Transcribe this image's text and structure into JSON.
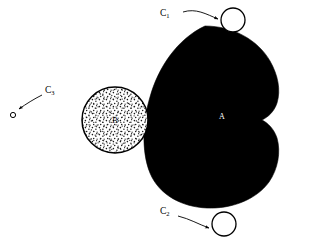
{
  "figure": {
    "background_color": "#ffffff",
    "ink_color": "#000000",
    "stipple_color": "#000000",
    "width": 309,
    "height": 248
  },
  "shapes": {
    "body_a": {
      "label": "A",
      "label_color": "#ffffff",
      "fill": "#000000",
      "label_x": 222,
      "label_y": 117,
      "description": "large-black-filled-blob-with-right-notch"
    },
    "body_b": {
      "label": "B",
      "label_color": "#000000",
      "fill": "stippled",
      "cx": 115,
      "cy": 120,
      "r": 33,
      "label_x": 115,
      "label_y": 121,
      "description": "stippled-outlined-circle"
    }
  },
  "callouts": [
    {
      "id": "c1",
      "letter": "C",
      "subscript": "1",
      "label_x": 160,
      "label_y": 14,
      "circle_cx": 233,
      "circle_cy": 20,
      "circle_r": 12,
      "arrow_from_x": 182,
      "arrow_from_y": 12,
      "arrow_to_x": 219,
      "arrow_to_y": 20
    },
    {
      "id": "c2",
      "letter": "C",
      "subscript": "2",
      "label_x": 160,
      "label_y": 212,
      "circle_cx": 224,
      "circle_cy": 224,
      "circle_r": 12,
      "arrow_from_x": 180,
      "arrow_from_y": 217,
      "arrow_to_x": 210,
      "arrow_to_y": 228
    },
    {
      "id": "c3",
      "letter": "C",
      "subscript": "3",
      "label_x": 45,
      "label_y": 91,
      "circle_cx": 13,
      "circle_cy": 115,
      "circle_r": 2.6,
      "arrow_from_x": 42,
      "arrow_from_y": 96,
      "arrow_to_x": 18,
      "arrow_to_y": 110
    }
  ]
}
